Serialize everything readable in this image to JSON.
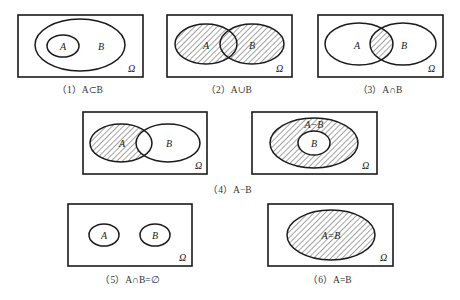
{
  "figure": {
    "universe_label": "Ω",
    "panels": [
      {
        "id": "1",
        "caption": "（1）A⊂B",
        "labels": {
          "a": "A",
          "b": "B"
        },
        "relation": "subset"
      },
      {
        "id": "2",
        "caption": "（2）A∪B",
        "labels": {
          "a": "A",
          "b": "B"
        },
        "relation": "union"
      },
      {
        "id": "3",
        "caption": "（3）A∩B",
        "labels": {
          "a": "A",
          "b": "B"
        },
        "relation": "intersection"
      },
      {
        "id": "4a",
        "caption": "",
        "labels": {
          "a": "A",
          "b": "B"
        },
        "relation": "difference-overlap"
      },
      {
        "id": "4b",
        "caption": "",
        "labels": {
          "a": "A−B",
          "b": "B"
        },
        "relation": "difference-nested"
      },
      {
        "id": "5",
        "caption": "（5）A∩B=∅",
        "labels": {
          "a": "A",
          "b": "B"
        },
        "relation": "disjoint"
      },
      {
        "id": "6",
        "caption": "（6）A=B",
        "labels": {
          "a": "A=B"
        },
        "relation": "equal"
      }
    ],
    "shared_caption_4": "（4）A−B",
    "colors": {
      "stroke": "#1a1a1a",
      "hatch": "#333333",
      "background": "#ffffff"
    }
  }
}
